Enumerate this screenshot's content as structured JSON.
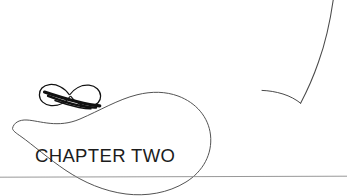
{
  "page": {
    "kind": "book-chapter-opening-page",
    "background_color": "#ffffff",
    "width": 347,
    "height": 196
  },
  "heading": {
    "text": "CHAPTER TWO",
    "color": "#1c1c1c"
  },
  "ornament": {
    "name": "infinity-flourish-ornament",
    "color": "#111111",
    "description": "calligraphic double-loop figure-eight flourish"
  },
  "decorations": {
    "teardrop_swash": {
      "name": "teardrop-swash-curve",
      "color": "#4a4a4a",
      "stroke_width": 0.9
    },
    "corner_swash": {
      "name": "corner-hook-curve",
      "color": "#4a4a4a",
      "stroke_width": 0.9
    }
  },
  "rule": {
    "name": "horizontal-rule",
    "color": "#8c8c8c",
    "y": 177
  }
}
